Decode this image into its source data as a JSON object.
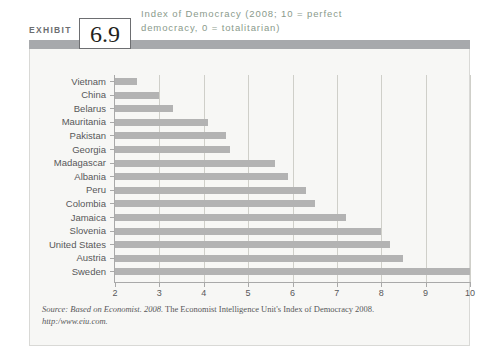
{
  "exhibit": {
    "label": "EXHIBIT",
    "number": "6.9"
  },
  "chart_data": {
    "type": "bar",
    "orientation": "horizontal",
    "title": "Index of Democracy (2008; 10 = perfect democracy, 0 = totalitarian)",
    "xlabel": "",
    "ylabel": "",
    "xlim": [
      2,
      10
    ],
    "xticks": [
      2,
      3,
      4,
      5,
      6,
      7,
      8,
      9,
      10
    ],
    "xtick_labels": [
      "2",
      "3",
      "4",
      "5",
      "6",
      "7",
      "8",
      "9",
      "10"
    ],
    "grid": true,
    "legend": false,
    "bar_color": "#b3b3b3",
    "categories": [
      "Vietnam",
      "China",
      "Belarus",
      "Mauritania",
      "Pakistan",
      "Georgia",
      "Madagascar",
      "Albania",
      "Peru",
      "Colombia",
      "Jamaica",
      "Slovenia",
      "United States",
      "Austria",
      "Sweden"
    ],
    "values": [
      2.5,
      3.0,
      3.3,
      4.1,
      4.5,
      4.6,
      5.6,
      5.9,
      6.3,
      6.5,
      7.2,
      8.0,
      8.2,
      8.5,
      10.0
    ]
  },
  "source": {
    "prefix": "Source: Based on Economist. 2008.",
    "text": " The Economist Intelligence Unit's Index of Democracy 2008.",
    "url": "http:/www.eiu.com."
  }
}
